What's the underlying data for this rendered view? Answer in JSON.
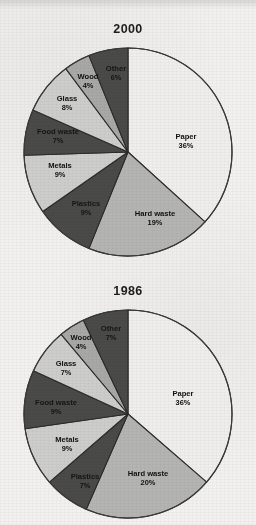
{
  "chart_data": [
    {
      "type": "pie",
      "title": "2000",
      "categories": [
        "Paper",
        "Hard waste",
        "Plastics",
        "Metals",
        "Food waste",
        "Glass",
        "Wood",
        "Other"
      ],
      "values": [
        36,
        19,
        9,
        9,
        7,
        8,
        4,
        6
      ],
      "value_labels": [
        "36%",
        "19%",
        "9%",
        "9%",
        "7%",
        "8%",
        "4%",
        "6%"
      ],
      "slice_colors": [
        "#efeeec",
        "#b4b4b2",
        "#4a4a48",
        "#cdcdcb",
        "#4a4a48",
        "#cdcdcb",
        "#a8a8a6",
        "#4a4a48"
      ],
      "start_angle_deg": 0,
      "direction": "clockwise",
      "legend": "none",
      "xlabel": "",
      "ylabel": ""
    },
    {
      "type": "pie",
      "title": "1986",
      "categories": [
        "Paper",
        "Hard waste",
        "Plastics",
        "Metals",
        "Food waste",
        "Glass",
        "Wood",
        "Other"
      ],
      "values": [
        36,
        20,
        7,
        9,
        9,
        7,
        4,
        7
      ],
      "value_labels": [
        "36%",
        "20%",
        "7%",
        "9%",
        "9%",
        "7%",
        "4%",
        "7%"
      ],
      "slice_colors": [
        "#efeeec",
        "#b4b4b2",
        "#4a4a48",
        "#cdcdcb",
        "#4a4a48",
        "#cdcdcb",
        "#a8a8a6",
        "#4a4a48"
      ],
      "start_angle_deg": 0,
      "direction": "clockwise",
      "legend": "none",
      "xlabel": "",
      "ylabel": ""
    }
  ],
  "charts": {
    "top": {
      "title": "2000",
      "slices": [
        {
          "name": "Paper",
          "pct": 36,
          "label": "Paper",
          "value_label": "36%",
          "color": "#efeeec",
          "text_class": "lbl-dark",
          "lx": 171,
          "ly": 98
        },
        {
          "name": "Hard waste",
          "pct": 19,
          "label": "Hard waste",
          "value_label": "19%",
          "color": "#b4b4b2",
          "text_class": "lbl-dark",
          "lx": 140,
          "ly": 175
        },
        {
          "name": "Plastics",
          "pct": 9,
          "label": "Plastics",
          "value_label": "9%",
          "color": "#4a4a48",
          "text_class": "lbl-onblack",
          "lx": 71,
          "ly": 165
        },
        {
          "name": "Metals",
          "pct": 9,
          "label": "Metals",
          "value_label": "9%",
          "color": "#cdcdcb",
          "text_class": "lbl-dark",
          "lx": 45,
          "ly": 127
        },
        {
          "name": "Food waste",
          "pct": 7,
          "label": "Food waste",
          "value_label": "7%",
          "color": "#4a4a48",
          "text_class": "lbl-onblack",
          "lx": 43,
          "ly": 93
        },
        {
          "name": "Glass",
          "pct": 8,
          "label": "Glass",
          "value_label": "8%",
          "color": "#cdcdcb",
          "text_class": "lbl-dark",
          "lx": 52,
          "ly": 60
        },
        {
          "name": "Wood",
          "pct": 4,
          "label": "Wood",
          "value_label": "4%",
          "color": "#a8a8a6",
          "text_class": "lbl-dark",
          "lx": 73,
          "ly": 38
        },
        {
          "name": "Other",
          "pct": 6,
          "label": "Other",
          "value_label": "6%",
          "color": "#4a4a48",
          "text_class": "lbl-onblack",
          "lx": 101,
          "ly": 30
        }
      ]
    },
    "bottom": {
      "title": "1986",
      "slices": [
        {
          "name": "Paper",
          "pct": 36,
          "label": "Paper",
          "value_label": "36%",
          "color": "#efeeec",
          "text_class": "lbl-dark",
          "lx": 168,
          "ly": 93
        },
        {
          "name": "Hard waste",
          "pct": 20,
          "label": "Hard waste",
          "value_label": "20%",
          "color": "#b4b4b2",
          "text_class": "lbl-dark",
          "lx": 133,
          "ly": 173
        },
        {
          "name": "Plastics",
          "pct": 7,
          "label": "Plastics",
          "value_label": "7%",
          "color": "#4a4a48",
          "text_class": "lbl-onblack",
          "lx": 70,
          "ly": 176
        },
        {
          "name": "Metals",
          "pct": 9,
          "label": "Metals",
          "value_label": "9%",
          "color": "#cdcdcb",
          "text_class": "lbl-dark",
          "lx": 52,
          "ly": 139
        },
        {
          "name": "Food waste",
          "pct": 9,
          "label": "Food waste",
          "value_label": "9%",
          "color": "#4a4a48",
          "text_class": "lbl-onblack",
          "lx": 41,
          "ly": 102
        },
        {
          "name": "Glass",
          "pct": 7,
          "label": "Glass",
          "value_label": "7%",
          "color": "#cdcdcb",
          "text_class": "lbl-dark",
          "lx": 51,
          "ly": 63
        },
        {
          "name": "Wood",
          "pct": 4,
          "label": "Wood",
          "value_label": "4%",
          "color": "#a8a8a6",
          "text_class": "lbl-dark",
          "lx": 66,
          "ly": 37
        },
        {
          "name": "Other",
          "pct": 7,
          "label": "Other",
          "value_label": "7%",
          "color": "#4a4a48",
          "text_class": "lbl-onblack",
          "lx": 96,
          "ly": 28
        }
      ]
    }
  }
}
